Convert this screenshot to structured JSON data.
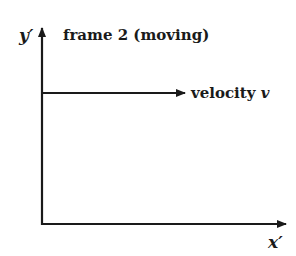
{
  "diagram": {
    "title": "frame 2 (moving)",
    "axes": {
      "y_label": "y′",
      "x_label": "x′"
    },
    "arrow": {
      "label": "velocity",
      "symbol": "v"
    },
    "colors": {
      "line": "#1a1a1a",
      "background": "#ffffff"
    }
  }
}
